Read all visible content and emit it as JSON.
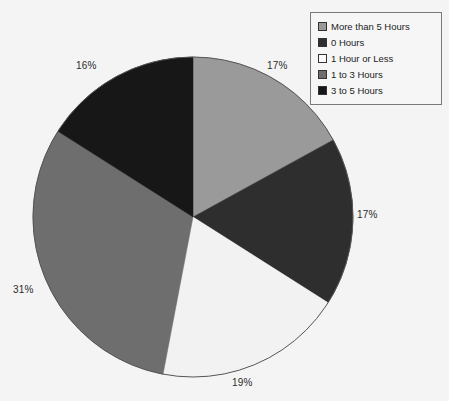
{
  "chart_data": {
    "type": "pie",
    "title": "",
    "categories": [
      "More than 5 Hours",
      "0 Hours",
      "1 Hour or Less",
      "1 to 3 Hours",
      "3 to 5 Hours"
    ],
    "values": [
      17,
      17,
      19,
      31,
      16
    ],
    "value_labels": [
      "17%",
      "17%",
      "19%",
      "31%",
      "16%"
    ],
    "unit": "percent",
    "colors": [
      "#9a9a9a",
      "#2e2e2e",
      "#f2f2f2",
      "#6e6e6e",
      "#171717"
    ],
    "legend_position": "top-right",
    "grid": false,
    "start_angle_deg": 0,
    "direction": "clockwise",
    "slice_order_from_top_clockwise": [
      "More than 5 Hours",
      "0 Hours",
      "1 Hour or Less",
      "1 to 3 Hours",
      "3 to 5 Hours"
    ]
  },
  "geometry": {
    "center_x": 193,
    "center_y": 217,
    "radius": 160
  },
  "legend": {
    "items": [
      {
        "label": "More than 5 Hours",
        "color": "#9a9a9a"
      },
      {
        "label": "0 Hours",
        "color": "#2e2e2e"
      },
      {
        "label": "1 Hour or Less",
        "color": "#fbfbfb"
      },
      {
        "label": "1 to 3 Hours",
        "color": "#6e6e6e"
      },
      {
        "label": "3 to 5 Hours",
        "color": "#171717"
      }
    ]
  },
  "labels": {
    "more_than_5_hours": "17%",
    "zero_hours": "17%",
    "one_hour_or_less": "19%",
    "one_to_three_hours": "31%",
    "three_to_five_hours": "16%"
  }
}
